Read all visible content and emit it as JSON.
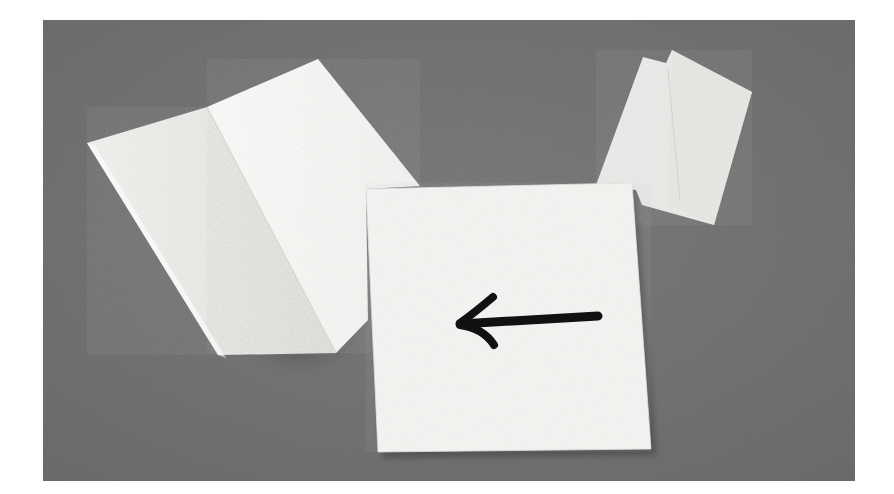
{
  "image": {
    "description": "Photograph of three white paper sheets on a gray background: a tri-folded sheet on the left, a small folded sheet at top right, and a flat sheet in front with a hand-drawn black arrow pointing left.",
    "colors": {
      "page_background": "#ffffff",
      "backdrop": "#777777",
      "backdrop_dark": "#6a6a6a",
      "paper": "#f7f7f5",
      "paper_shade": "#e6e6e3",
      "ink": "#111111"
    },
    "objects": [
      {
        "name": "folded-sheet-left",
        "kind": "paper"
      },
      {
        "name": "folded-sheet-right",
        "kind": "paper"
      },
      {
        "name": "front-sheet",
        "kind": "paper"
      },
      {
        "name": "left-arrow",
        "kind": "drawing",
        "direction": "left"
      }
    ]
  }
}
